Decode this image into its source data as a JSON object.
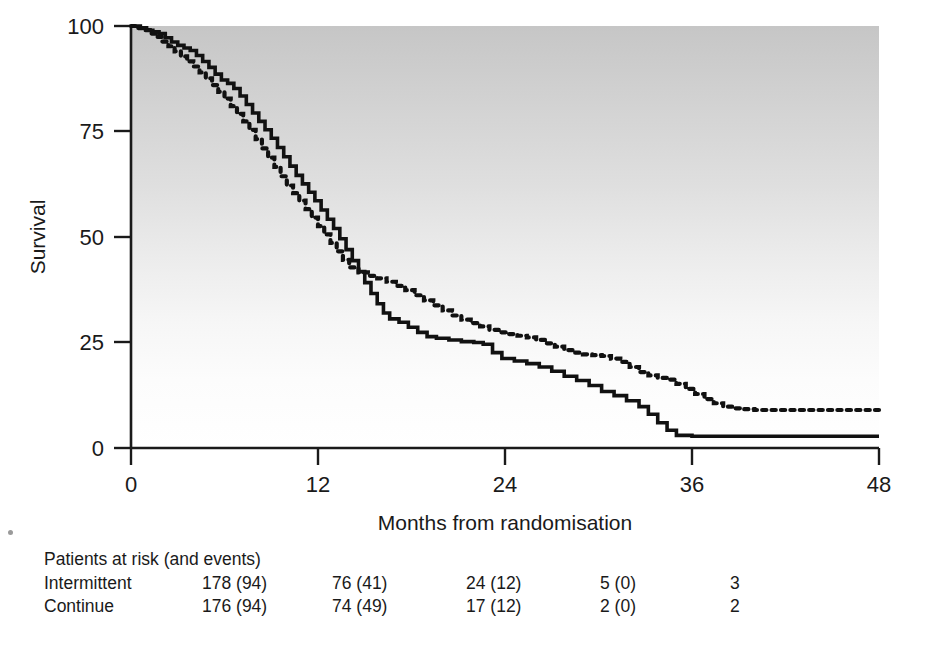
{
  "chart_data": {
    "type": "line",
    "title": "",
    "xlabel": "Months from randomisation",
    "ylabel": "Survival",
    "xlim": [
      0,
      48
    ],
    "ylim": [
      0,
      100
    ],
    "xticks": [
      0,
      12,
      24,
      36,
      48
    ],
    "yticks": [
      0,
      25,
      50,
      75,
      100
    ],
    "xticklabels": [
      "0",
      "12",
      "24",
      "36",
      "48"
    ],
    "yticklabels": [
      "0",
      "25",
      "50",
      "75",
      "100"
    ],
    "grid": false,
    "legend": "none",
    "background": "vertical-gradient-grey-to-white",
    "series": [
      {
        "name": "Intermittent",
        "style": "dotted",
        "color": "#111111",
        "points": [
          [
            0,
            100
          ],
          [
            0.4,
            99.5
          ],
          [
            0.8,
            99.0
          ],
          [
            1.2,
            98.2
          ],
          [
            1.6,
            97.4
          ],
          [
            2.0,
            96.3
          ],
          [
            2.4,
            95.2
          ],
          [
            2.8,
            94.0
          ],
          [
            3.2,
            92.8
          ],
          [
            3.6,
            91.6
          ],
          [
            4.0,
            90.4
          ],
          [
            4.4,
            89.0
          ],
          [
            4.8,
            87.6
          ],
          [
            5.2,
            86.0
          ],
          [
            5.6,
            84.4
          ],
          [
            6.0,
            82.8
          ],
          [
            6.4,
            81.0
          ],
          [
            6.8,
            79.2
          ],
          [
            7.2,
            77.4
          ],
          [
            7.6,
            75.4
          ],
          [
            8.0,
            73.2
          ],
          [
            8.4,
            71.0
          ],
          [
            8.8,
            68.8
          ],
          [
            9.2,
            66.6
          ],
          [
            9.6,
            64.4
          ],
          [
            10.0,
            62.2
          ],
          [
            10.4,
            60.4
          ],
          [
            10.8,
            58.6
          ],
          [
            11.2,
            56.6
          ],
          [
            11.6,
            54.6
          ],
          [
            12.0,
            52.6
          ],
          [
            12.4,
            50.6
          ],
          [
            12.8,
            48.6
          ],
          [
            13.2,
            46.6
          ],
          [
            13.6,
            44.6
          ],
          [
            14.0,
            42.8
          ],
          [
            14.6,
            41.6
          ],
          [
            15.2,
            40.8
          ],
          [
            15.8,
            40.2
          ],
          [
            16.4,
            39.4
          ],
          [
            17.0,
            38.4
          ],
          [
            17.6,
            37.4
          ],
          [
            18.2,
            36.2
          ],
          [
            18.8,
            35.0
          ],
          [
            19.4,
            33.8
          ],
          [
            20.0,
            32.6
          ],
          [
            20.6,
            31.4
          ],
          [
            21.2,
            30.4
          ],
          [
            21.8,
            29.6
          ],
          [
            22.4,
            28.8
          ],
          [
            23.0,
            28.0
          ],
          [
            23.6,
            27.4
          ],
          [
            24.2,
            27.0
          ],
          [
            24.8,
            26.6
          ],
          [
            25.4,
            26.2
          ],
          [
            26.0,
            25.6
          ],
          [
            26.6,
            24.8
          ],
          [
            27.2,
            24.0
          ],
          [
            27.8,
            23.2
          ],
          [
            28.4,
            22.6
          ],
          [
            29.0,
            22.2
          ],
          [
            29.6,
            22.0
          ],
          [
            30.2,
            21.8
          ],
          [
            30.8,
            21.2
          ],
          [
            31.4,
            20.4
          ],
          [
            32.0,
            19.2
          ],
          [
            32.6,
            18.0
          ],
          [
            33.2,
            17.2
          ],
          [
            33.8,
            16.6
          ],
          [
            34.4,
            16.2
          ],
          [
            35.0,
            15.2
          ],
          [
            35.6,
            14.0
          ],
          [
            36.2,
            12.8
          ],
          [
            36.8,
            11.6
          ],
          [
            37.4,
            10.6
          ],
          [
            38.0,
            9.8
          ],
          [
            38.6,
            9.4
          ],
          [
            39.2,
            9.2
          ],
          [
            40.0,
            9.0
          ],
          [
            42.0,
            9.0
          ],
          [
            44.0,
            9.0
          ],
          [
            46.0,
            9.0
          ],
          [
            48.0,
            9.0
          ]
        ]
      },
      {
        "name": "Continue",
        "style": "solid",
        "color": "#111111",
        "points": [
          [
            0,
            100
          ],
          [
            0.3,
            100
          ],
          [
            0.6,
            99.6
          ],
          [
            1.0,
            99.0
          ],
          [
            1.4,
            98.6
          ],
          [
            1.8,
            98.2
          ],
          [
            2.2,
            97.2
          ],
          [
            2.6,
            96.2
          ],
          [
            3.0,
            95.4
          ],
          [
            3.4,
            94.8
          ],
          [
            3.8,
            94.2
          ],
          [
            4.2,
            93.0
          ],
          [
            4.6,
            91.6
          ],
          [
            5.0,
            90.2
          ],
          [
            5.4,
            88.6
          ],
          [
            5.8,
            87.2
          ],
          [
            6.2,
            86.4
          ],
          [
            6.6,
            85.2
          ],
          [
            7.0,
            83.4
          ],
          [
            7.4,
            81.4
          ],
          [
            7.8,
            79.4
          ],
          [
            8.2,
            77.4
          ],
          [
            8.6,
            75.4
          ],
          [
            9.0,
            73.4
          ],
          [
            9.4,
            71.2
          ],
          [
            9.8,
            69.0
          ],
          [
            10.2,
            66.8
          ],
          [
            10.6,
            64.6
          ],
          [
            11.0,
            62.6
          ],
          [
            11.4,
            60.6
          ],
          [
            11.8,
            58.6
          ],
          [
            12.2,
            56.4
          ],
          [
            12.6,
            54.2
          ],
          [
            13.0,
            52.0
          ],
          [
            13.4,
            49.6
          ],
          [
            13.8,
            47.0
          ],
          [
            14.2,
            44.4
          ],
          [
            14.6,
            41.8
          ],
          [
            15.0,
            39.2
          ],
          [
            15.4,
            36.6
          ],
          [
            15.8,
            34.2
          ],
          [
            16.2,
            32.0
          ],
          [
            16.6,
            30.6
          ],
          [
            17.2,
            29.8
          ],
          [
            17.8,
            28.6
          ],
          [
            18.4,
            27.4
          ],
          [
            19.0,
            26.4
          ],
          [
            19.6,
            26.0
          ],
          [
            20.4,
            25.6
          ],
          [
            21.2,
            25.2
          ],
          [
            22.0,
            25.0
          ],
          [
            22.6,
            24.6
          ],
          [
            23.2,
            22.6
          ],
          [
            23.8,
            21.2
          ],
          [
            24.6,
            20.6
          ],
          [
            25.4,
            20.0
          ],
          [
            26.2,
            19.2
          ],
          [
            27.0,
            18.2
          ],
          [
            27.8,
            17.0
          ],
          [
            28.6,
            16.0
          ],
          [
            29.4,
            14.8
          ],
          [
            30.2,
            13.4
          ],
          [
            31.0,
            12.4
          ],
          [
            31.8,
            11.2
          ],
          [
            32.6,
            9.8
          ],
          [
            33.2,
            8.0
          ],
          [
            33.8,
            6.0
          ],
          [
            34.4,
            4.2
          ],
          [
            35.0,
            3.0
          ],
          [
            36.0,
            2.8
          ],
          [
            38.0,
            2.8
          ],
          [
            40.0,
            2.8
          ],
          [
            44.0,
            2.8
          ],
          [
            48.0,
            2.8
          ]
        ]
      }
    ]
  },
  "axes": {
    "y_label": "Survival",
    "x_label": "Months from randomisation",
    "y_ticks": [
      "100",
      "75",
      "50",
      "25",
      "0"
    ],
    "x_ticks": [
      "0",
      "12",
      "24",
      "36",
      "48"
    ]
  },
  "risk_table": {
    "heading": "Patients at risk (and events)",
    "rows": [
      {
        "label": "Intermittent",
        "cells": [
          "178 (94)",
          "76 (41)",
          "24 (12)",
          "5 (0)",
          "3"
        ]
      },
      {
        "label": "Continue",
        "cells": [
          "176 (94)",
          "74 (49)",
          "17 (12)",
          "2 (0)",
          "2"
        ]
      }
    ]
  },
  "colors": {
    "ink": "#111111",
    "plot_top_grey": "#c9c9c9",
    "plot_bottom_grey": "#ffffff"
  }
}
